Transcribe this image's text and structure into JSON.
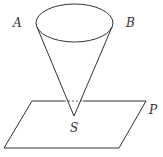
{
  "diagram": {
    "labels": {
      "A": "A",
      "B": "B",
      "S": "S",
      "P": "P"
    },
    "colors": {
      "stroke": "#333333",
      "background": "#ffffff"
    },
    "cone": {
      "base_center": [
        74.5,
        23
      ],
      "base_rx": 38.5,
      "base_ry": 19,
      "apex": [
        74,
        116
      ]
    },
    "plane": {
      "vertices": [
        [
          32,
          101
        ],
        [
          146,
          101
        ],
        [
          119,
          148
        ],
        [
          4,
          148
        ]
      ]
    }
  }
}
